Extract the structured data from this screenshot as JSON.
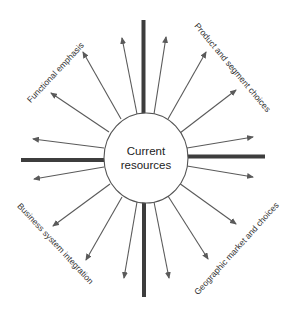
{
  "diagram": {
    "center": {
      "line1": "Current",
      "line2": "resources"
    },
    "labels": {
      "top_left": "Functional emphasis",
      "top_right": "Product and segment choices",
      "bottom_left": "Business system integration",
      "bottom_right": "Geographic market and choices"
    },
    "quadrants": [
      {
        "position": "top-left",
        "label": "Functional emphasis",
        "arrow_count": 4
      },
      {
        "position": "top-right",
        "label": "Product and segment choices",
        "arrow_count": 4
      },
      {
        "position": "bottom-left",
        "label": "Business system integration",
        "arrow_count": 4
      },
      {
        "position": "bottom-right",
        "label": "Geographic market and choices",
        "arrow_count": 4
      }
    ],
    "colors": {
      "axis": "#3d3d3d",
      "arrow": "#5a5a5a",
      "ellipse_stroke": "#555555",
      "text": "#222222",
      "background": "#ffffff"
    }
  }
}
